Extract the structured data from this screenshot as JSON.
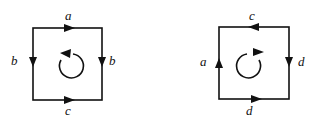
{
  "diagrams": [
    {
      "name": "left-square",
      "labels": {
        "top": "a",
        "left": "b",
        "right": "b",
        "bottom": "c"
      },
      "edge_directions": {
        "top": "right",
        "left": "down",
        "right": "down",
        "bottom": "right"
      },
      "rotation": "counterclockwise"
    },
    {
      "name": "right-square",
      "labels": {
        "top": "c",
        "left": "a",
        "right": "d",
        "bottom": "d"
      },
      "edge_directions": {
        "top": "left",
        "left": "up",
        "right": "down",
        "bottom": "right"
      },
      "rotation": "clockwise"
    }
  ],
  "colors": {
    "stroke": "#111111",
    "background": "#ffffff"
  }
}
